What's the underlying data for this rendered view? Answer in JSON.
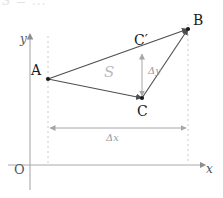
{
  "figure": {
    "type": "geometry-diagram",
    "top_cropped_text": "S = ...",
    "axes": {
      "y_label": "y",
      "x_label": "x",
      "origin_label": "O",
      "axis_color": "#a9aaae",
      "origin_px": [
        30,
        165
      ],
      "x_axis_end_px": [
        207,
        165
      ],
      "y_axis_top_px": [
        30,
        32
      ]
    },
    "points": [
      {
        "name": "A",
        "label": "A",
        "x": 48,
        "y": 79,
        "label_dx": -14,
        "label_dy": -16
      },
      {
        "name": "B",
        "label": "B",
        "x": 188,
        "y": 29,
        "label_dx": 5,
        "label_dy": -16
      },
      {
        "name": "C",
        "label": "C",
        "x": 142,
        "y": 98,
        "label_dx": 0,
        "label_dy": 6
      },
      {
        "name": "Cp",
        "label": "C′",
        "x": 142,
        "y": 52,
        "label_dx": -6,
        "label_dy": -18
      }
    ],
    "edges": [
      {
        "name": "edge-a-to-cprime-to-b",
        "from": "A",
        "to": "B",
        "arrow": true
      },
      {
        "name": "edge-a-to-c",
        "from": "A",
        "to": "C",
        "arrow": true
      },
      {
        "name": "edge-c-to-b",
        "from": "C",
        "to": "B",
        "arrow": true
      }
    ],
    "area_label": "S",
    "area_label_px": [
      104,
      73
    ],
    "delta_y": {
      "label": "Δy",
      "label_px": [
        150,
        70
      ],
      "from_px": [
        142,
        52
      ],
      "to_px": [
        142,
        98
      ]
    },
    "delta_x": {
      "label": "Δx",
      "label_px": [
        108,
        134
      ],
      "from_px": [
        48,
        128
      ],
      "to_px": [
        188,
        128
      ]
    },
    "guides": [
      {
        "name": "dashed-guide-at-A",
        "x": 48,
        "y1": 36,
        "y2": 163
      },
      {
        "name": "dashed-guide-at-B",
        "x": 188,
        "y1": 24,
        "y2": 163
      }
    ],
    "colors": {
      "line": "#4d4e52",
      "axis": "#a9aaae",
      "guide": "#c9cacd",
      "measure": "#a5a6aa",
      "area_text": "#b9babd"
    }
  }
}
